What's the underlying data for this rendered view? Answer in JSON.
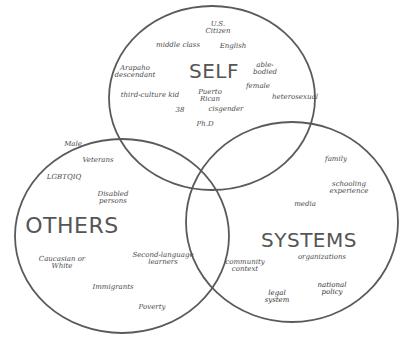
{
  "diagram": {
    "type": "venn",
    "circles": [
      {
        "id": "self",
        "title": "SELF",
        "cx": 212,
        "cy": 98,
        "rx": 103,
        "ry": 92
      },
      {
        "id": "others",
        "title": "OTHERS",
        "cx": 122,
        "cy": 236,
        "rx": 107,
        "ry": 97
      },
      {
        "id": "systems",
        "title": "SYSTEMS",
        "cx": 292,
        "cy": 222,
        "rx": 106,
        "ry": 100
      }
    ],
    "stroke_color": "#5a5a5a"
  },
  "self": {
    "title": "SELF",
    "items": [
      {
        "text": "U.S.\nCitizen",
        "x": 218,
        "y": 28
      },
      {
        "text": "middle class",
        "x": 178,
        "y": 45
      },
      {
        "text": "English",
        "x": 233,
        "y": 46
      },
      {
        "text": "Arapaho\ndescendant",
        "x": 135,
        "y": 72
      },
      {
        "text": "able-\nbodied",
        "x": 265,
        "y": 69
      },
      {
        "text": "female",
        "x": 258,
        "y": 86
      },
      {
        "text": "third-culture kid",
        "x": 150,
        "y": 95
      },
      {
        "text": "Puerto\nRican",
        "x": 210,
        "y": 96
      },
      {
        "text": "heterosexual",
        "x": 295,
        "y": 97
      },
      {
        "text": "38",
        "x": 180,
        "y": 110
      },
      {
        "text": "cisgender",
        "x": 226,
        "y": 109
      },
      {
        "text": "Ph.D",
        "x": 205,
        "y": 124
      }
    ]
  },
  "others": {
    "title": "OTHERS",
    "items": [
      {
        "text": "Male",
        "x": 73,
        "y": 144
      },
      {
        "text": "Veterans",
        "x": 98,
        "y": 160
      },
      {
        "text": "LGBTQIQ",
        "x": 64,
        "y": 177
      },
      {
        "text": "Disabled\npersons",
        "x": 113,
        "y": 198
      },
      {
        "text": "Caucasian or\nWhite",
        "x": 62,
        "y": 263
      },
      {
        "text": "Second-language\nlearners",
        "x": 163,
        "y": 259
      },
      {
        "text": "Immigrants",
        "x": 113,
        "y": 287
      },
      {
        "text": "Poverty",
        "x": 152,
        "y": 307
      }
    ]
  },
  "systems": {
    "title": "SYSTEMS",
    "items": [
      {
        "text": "family",
        "x": 336,
        "y": 159
      },
      {
        "text": "schooling\nexperience",
        "x": 349,
        "y": 188
      },
      {
        "text": "media",
        "x": 305,
        "y": 204
      },
      {
        "text": "community\ncontext",
        "x": 245,
        "y": 266
      },
      {
        "text": "organizations",
        "x": 322,
        "y": 257
      },
      {
        "text": "national\npolicy",
        "x": 332,
        "y": 289
      },
      {
        "text": "legal\nsystem",
        "x": 277,
        "y": 297
      }
    ]
  }
}
